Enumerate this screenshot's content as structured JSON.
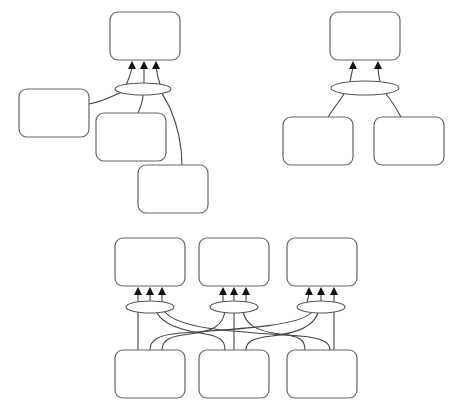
{
  "diagram": {
    "type": "hypergraph-flow",
    "colors": {
      "box_stroke": "#666666",
      "edge_stroke": "#444444",
      "arrow_fill": "#111111",
      "background": "#ffffff"
    },
    "panels": [
      {
        "id": "top-left",
        "boxes": [
          {
            "id": "tl-target",
            "x": 110,
            "y": 12,
            "w": 70,
            "h": 48,
            "label": ""
          },
          {
            "id": "tl-src-1",
            "x": 19,
            "y": 89,
            "w": 70,
            "h": 48,
            "label": ""
          },
          {
            "id": "tl-src-2",
            "x": 96,
            "y": 113,
            "w": 70,
            "h": 48,
            "label": ""
          },
          {
            "id": "tl-src-3",
            "x": 138,
            "y": 165,
            "w": 70,
            "h": 48,
            "label": ""
          }
        ],
        "junction": {
          "cx": 143,
          "cy": 89,
          "rx": 28,
          "ry": 6
        },
        "arrows_x": [
          132,
          144,
          156
        ],
        "arrow_tip_y": 61
      },
      {
        "id": "top-right",
        "boxes": [
          {
            "id": "tr-target",
            "x": 330,
            "y": 12,
            "w": 70,
            "h": 48,
            "label": ""
          },
          {
            "id": "tr-src-1",
            "x": 283,
            "y": 117,
            "w": 70,
            "h": 48,
            "label": ""
          },
          {
            "id": "tr-src-2",
            "x": 374,
            "y": 117,
            "w": 70,
            "h": 48,
            "label": ""
          }
        ],
        "junction": {
          "cx": 365,
          "cy": 88,
          "rx": 34,
          "ry": 7
        },
        "arrows_x": [
          353,
          378
        ],
        "arrow_tip_y": 61
      },
      {
        "id": "bottom",
        "targets": [
          {
            "id": "b-target-1",
            "x": 115,
            "y": 238,
            "w": 70,
            "h": 48,
            "label": ""
          },
          {
            "id": "b-target-2",
            "x": 199,
            "y": 238,
            "w": 70,
            "h": 48,
            "label": ""
          },
          {
            "id": "b-target-3",
            "x": 287,
            "y": 238,
            "w": 70,
            "h": 48,
            "label": ""
          }
        ],
        "sources": [
          {
            "id": "b-src-1",
            "x": 115,
            "y": 350,
            "w": 70,
            "h": 48,
            "label": ""
          },
          {
            "id": "b-src-2",
            "x": 199,
            "y": 350,
            "w": 70,
            "h": 48,
            "label": ""
          },
          {
            "id": "b-src-3",
            "x": 287,
            "y": 350,
            "w": 70,
            "h": 48,
            "label": ""
          }
        ],
        "junctions": [
          {
            "cx": 150,
            "cy": 307,
            "rx": 24,
            "ry": 6,
            "arrows_x": [
              138,
              150,
              162
            ]
          },
          {
            "cx": 234,
            "cy": 307,
            "rx": 24,
            "ry": 6,
            "arrows_x": [
              223,
              234,
              246
            ]
          },
          {
            "cx": 321,
            "cy": 307,
            "rx": 24,
            "ry": 6,
            "arrows_x": [
              309,
              321,
              334
            ]
          }
        ],
        "arrow_tip_y": 287
      }
    ]
  }
}
